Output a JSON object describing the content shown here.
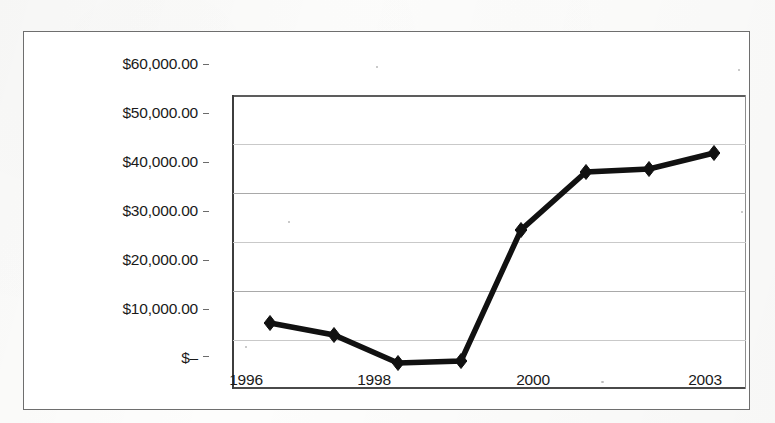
{
  "chart_data": {
    "type": "line",
    "title": "",
    "subtitle": "",
    "xlabel": "",
    "ylabel": "",
    "grid": true,
    "legend": "none",
    "marker": "diamond",
    "line_color": "#111111",
    "categories": [
      "1996",
      "1997",
      "1998",
      "1999",
      "2000",
      "2001",
      "2002",
      "2003"
    ],
    "x_tick_labels": [
      "1996",
      "1998",
      "2000",
      "2003"
    ],
    "x_tick_label_positions": [
      0,
      2,
      4,
      7
    ],
    "y_tick_labels": [
      "$60,000.00",
      "$50,000.00",
      "$40,000.00",
      "$30,000.00",
      "$20,000.00",
      "$10,000.00",
      "$–"
    ],
    "y_tick_values": [
      60000,
      50000,
      40000,
      30000,
      20000,
      10000,
      0
    ],
    "ylim": [
      0,
      60000
    ],
    "series": [
      {
        "name": "Series 1",
        "values": [
          13500,
          11100,
          5300,
          5700,
          32600,
          44500,
          45100,
          49200
        ]
      }
    ],
    "points": [
      {
        "x": "1996",
        "y": 13500
      },
      {
        "x": "1997",
        "y": 11100
      },
      {
        "x": "1998",
        "y": 5300
      },
      {
        "x": "1999",
        "y": 5700
      },
      {
        "x": "2000",
        "y": 32600
      },
      {
        "x": "2001",
        "y": 44500
      },
      {
        "x": "2002",
        "y": 45100
      },
      {
        "x": "2003",
        "y": 49200
      }
    ]
  },
  "axis": {
    "y": {
      "labels": [
        {
          "text": "$60,000.00",
          "value": 60000,
          "top": 55
        },
        {
          "text": "$50,000.00",
          "value": 50000,
          "top": 104
        },
        {
          "text": "$40,000.00",
          "value": 40000,
          "top": 153
        },
        {
          "text": "$30,000.00",
          "value": 30000,
          "top": 202
        },
        {
          "text": "$20,000.00",
          "value": 20000,
          "top": 251
        },
        {
          "text": "$10,000.00",
          "value": 10000,
          "top": 300
        },
        {
          "text": "$–",
          "value": 0,
          "top": 349
        }
      ]
    },
    "x": {
      "labels": [
        {
          "text": "1996",
          "left": 246,
          "top": 371
        },
        {
          "text": "1998",
          "left": 374,
          "top": 371
        },
        {
          "text": "2000",
          "left": 533,
          "top": 371
        },
        {
          "text": "2003",
          "left": 705,
          "top": 371
        }
      ]
    }
  },
  "geometry": {
    "plot": {
      "left": 208,
      "top": 63,
      "width": 514,
      "height": 294
    },
    "gridline_tops": [
      0,
      49,
      98,
      147,
      196,
      245,
      292
    ],
    "marker_px": [
      {
        "x": 38,
        "y": 228
      },
      {
        "x": 102,
        "y": 240
      },
      {
        "x": 166,
        "y": 268
      },
      {
        "x": 229,
        "y": 266
      },
      {
        "x": 289,
        "y": 135
      },
      {
        "x": 354,
        "y": 77
      },
      {
        "x": 417,
        "y": 74
      },
      {
        "x": 482,
        "y": 58
      }
    ]
  }
}
